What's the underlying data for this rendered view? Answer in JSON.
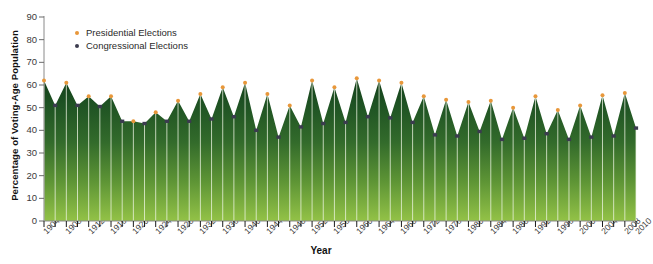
{
  "chart_data": {
    "type": "area",
    "title": "",
    "xlabel": "Year",
    "ylabel": "Percentage of Voting-Age Population",
    "ylim": [
      0,
      90
    ],
    "yticks": [
      0,
      10,
      20,
      30,
      40,
      50,
      60,
      70,
      80,
      90
    ],
    "xlim": [
      1904,
      2010
    ],
    "xticks": [
      1904,
      1908,
      1912,
      1916,
      1920,
      1924,
      1928,
      1932,
      1936,
      1940,
      1944,
      1948,
      1952,
      1956,
      1960,
      1964,
      1968,
      1972,
      1976,
      1980,
      1984,
      1988,
      1992,
      1996,
      2000,
      2004,
      2008,
      2010
    ],
    "grid": false,
    "legend_position": "top-left",
    "legend": [
      {
        "label": "Presidential Elections",
        "color": "#E8973A",
        "key": "presidential"
      },
      {
        "label": "Congressional Elections",
        "color": "#3B3B4F",
        "key": "congressional"
      }
    ],
    "series_colors": {
      "presidential": "#E8973A",
      "congressional": "#3B3B4F"
    },
    "area_color_top": "#1d4d22",
    "area_color_bottom": "#8fbe46",
    "x": [
      1904,
      1906,
      1908,
      1910,
      1912,
      1914,
      1916,
      1918,
      1920,
      1922,
      1924,
      1926,
      1928,
      1930,
      1932,
      1934,
      1936,
      1938,
      1940,
      1942,
      1944,
      1946,
      1948,
      1950,
      1952,
      1954,
      1956,
      1958,
      1960,
      1962,
      1964,
      1966,
      1968,
      1970,
      1972,
      1974,
      1976,
      1978,
      1980,
      1982,
      1984,
      1986,
      1988,
      1990,
      1992,
      1994,
      1996,
      1998,
      2000,
      2002,
      2004,
      2006,
      2008,
      2010
    ],
    "values": [
      62.0,
      51.0,
      61.0,
      51.0,
      55.0,
      50.5,
      55.0,
      44.0,
      44.0,
      43.0,
      48.0,
      44.0,
      53.0,
      44.0,
      56.0,
      45.0,
      59.0,
      46.0,
      61.0,
      40.0,
      56.0,
      37.0,
      51.0,
      41.5,
      62.0,
      43.0,
      59.0,
      43.5,
      63.0,
      46.0,
      62.0,
      45.5,
      61.0,
      43.5,
      55.0,
      38.0,
      53.5,
      37.5,
      52.5,
      39.5,
      53.0,
      36.0,
      50.0,
      36.5,
      55.0,
      38.5,
      49.0,
      36.0,
      51.0,
      37.0,
      55.5,
      37.5,
      56.5,
      41.0
    ],
    "point_types": [
      "presidential",
      "congressional",
      "presidential",
      "congressional",
      "presidential",
      "congressional",
      "presidential",
      "congressional",
      "presidential",
      "congressional",
      "presidential",
      "congressional",
      "presidential",
      "congressional",
      "presidential",
      "congressional",
      "presidential",
      "congressional",
      "presidential",
      "congressional",
      "presidential",
      "congressional",
      "presidential",
      "congressional",
      "presidential",
      "congressional",
      "presidential",
      "congressional",
      "presidential",
      "congressional",
      "presidential",
      "congressional",
      "presidential",
      "congressional",
      "presidential",
      "congressional",
      "presidential",
      "congressional",
      "presidential",
      "congressional",
      "presidential",
      "congressional",
      "presidential",
      "congressional",
      "presidential",
      "congressional",
      "presidential",
      "congressional",
      "presidential",
      "congressional",
      "presidential",
      "congressional",
      "presidential",
      "congressional"
    ]
  }
}
